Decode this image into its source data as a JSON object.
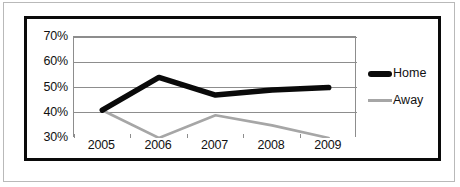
{
  "chart_data": {
    "type": "line",
    "title": "",
    "xlabel": "",
    "ylabel": "",
    "x": [
      "2005",
      "2006",
      "2007",
      "2008",
      "2009"
    ],
    "categories": [
      "2005",
      "2006",
      "2007",
      "2008",
      "2009"
    ],
    "ylim": [
      30,
      70
    ],
    "ytick_labels": [
      "70%",
      "60%",
      "50%",
      "40%",
      "30%"
    ],
    "ytick_values": [
      70,
      60,
      50,
      40,
      30
    ],
    "grid": "horizontal",
    "legend_position": "right",
    "series": [
      {
        "name": "Home",
        "color": "#0a0a0a",
        "width": 5.5,
        "values": [
          41,
          54,
          47,
          49,
          50
        ]
      },
      {
        "name": "Away",
        "color": "#a6a6a6",
        "width": 2.6,
        "values": [
          41,
          30,
          39,
          35,
          30
        ]
      }
    ]
  },
  "legend": {
    "items": [
      {
        "label": "Home",
        "swatch": "thick-black-line-swatch"
      },
      {
        "label": "Away",
        "swatch": "thin-gray-line-swatch"
      }
    ]
  },
  "axes": {
    "y_ticks": [
      "70%",
      "60%",
      "50%",
      "40%",
      "30%"
    ],
    "x_ticks": [
      "2005",
      "2006",
      "2007",
      "2008",
      "2009"
    ]
  },
  "colors": {
    "home_series": "#0a0a0a",
    "away_series": "#a6a6a6",
    "gridline": "#8d8d8d",
    "frame": "#0a0a0a",
    "outer_border": "#b9b9b9",
    "text": "#111111",
    "background": "#ffffff"
  }
}
